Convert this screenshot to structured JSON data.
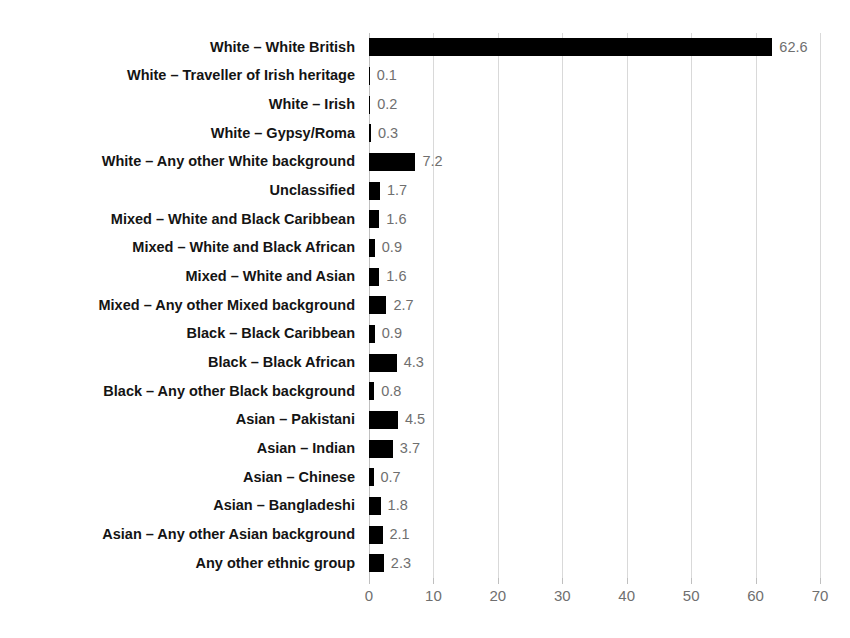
{
  "chart_data": {
    "type": "bar",
    "orientation": "horizontal",
    "title": "",
    "xlabel": "",
    "ylabel": "",
    "xlim": [
      0,
      70
    ],
    "xticks": [
      0,
      10,
      20,
      30,
      40,
      50,
      60,
      70
    ],
    "grid": "vertical",
    "legend": "none",
    "bar_color": "#000000",
    "value_label_color": "#6f6f6f",
    "category_label_color": "#141414",
    "categories": [
      "White – White British",
      "White – Traveller of Irish heritage",
      "White – Irish",
      "White – Gypsy/Roma",
      "White – Any other White background",
      "Unclassified",
      "Mixed – White and Black Caribbean",
      "Mixed – White and Black African",
      "Mixed – White and Asian",
      "Mixed – Any other Mixed background",
      "Black – Black Caribbean",
      "Black – Black African",
      "Black – Any other Black background",
      "Asian – Pakistani",
      "Asian – Indian",
      "Asian – Chinese",
      "Asian – Bangladeshi",
      "Asian – Any other Asian background",
      "Any other ethnic group"
    ],
    "values": [
      62.6,
      0.1,
      0.2,
      0.3,
      7.2,
      1.7,
      1.6,
      0.9,
      1.6,
      2.7,
      0.9,
      4.3,
      0.8,
      4.5,
      3.7,
      0.7,
      1.8,
      2.1,
      2.3
    ],
    "value_labels": [
      "62.6",
      "0.1",
      "0.2",
      "0.3",
      "7.2",
      "1.7",
      "1.6",
      "0.9",
      "1.6",
      "2.7",
      "0.9",
      "4.3",
      "0.8",
      "4.5",
      "3.7",
      "0.7",
      "1.8",
      "2.1",
      "2.3"
    ],
    "xtick_labels": [
      "0",
      "10",
      "20",
      "30",
      "40",
      "50",
      "60",
      "70"
    ]
  }
}
